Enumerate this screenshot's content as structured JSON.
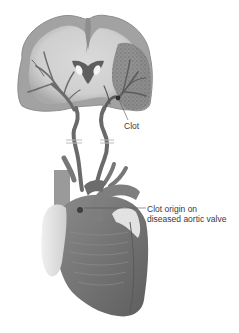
{
  "figure": {
    "parts": [
      "brain-coronal-section",
      "cerebral-arteries",
      "carotid-arteries",
      "heart"
    ],
    "colors": {
      "background": "#ffffff",
      "brain_cortex": "#9a9a9a",
      "brain_white_matter": "#d2d2d2",
      "ischemic_region": "#7c7c7c",
      "vessel": "#6e6e6e",
      "heart_muscle": "#767676",
      "fat": "#e4e4e4",
      "label_text": "#3a3a3a",
      "leader_line": "#555555"
    }
  },
  "labels": {
    "clot": "Clot",
    "clot_origin_line1": "Clot origin on",
    "clot_origin_line2": "diseased aortic valve"
  }
}
